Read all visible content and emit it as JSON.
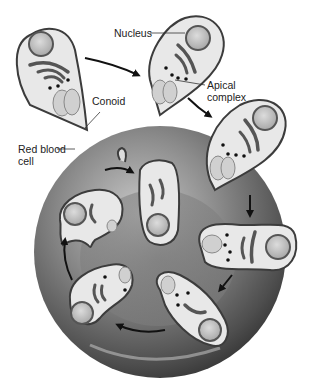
{
  "diagram": {
    "labels": {
      "nucleus": "Nucleus",
      "conoid": "Conoid",
      "apical_complex": "Apical\ncomplex",
      "red_blood_cell": "Red blood\ncell"
    },
    "colors": {
      "rbc_light": "#bdbdbd",
      "rbc_dark": "#3a3a3a",
      "parasite_fill": "#e6e6e6",
      "parasite_outline": "#3c3c3c",
      "nucleus_fill": "#c4c4c4",
      "arrow": "#111111"
    }
  }
}
